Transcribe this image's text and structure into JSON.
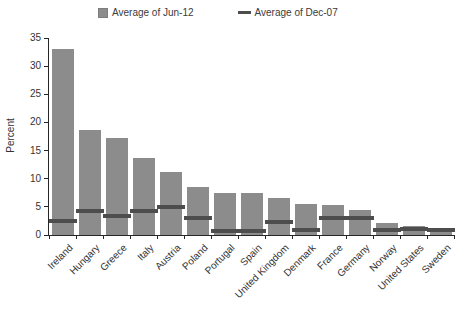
{
  "legend": {
    "items": [
      {
        "label": "Average of Jun-12",
        "marker": "square-icon",
        "color": "#8c8c8c"
      },
      {
        "label": "Average of Dec-07",
        "marker": "dash-icon",
        "color": "#4d4d4d"
      }
    ]
  },
  "chart_data": {
    "type": "bar",
    "title": "",
    "ylabel": "Percent",
    "xlabel": "",
    "ylim": [
      0,
      35
    ],
    "yticks": [
      0,
      5,
      10,
      15,
      20,
      25,
      30,
      35
    ],
    "grid": false,
    "legend_position": "top",
    "categories": [
      "Ireland",
      "Hungary",
      "Greece",
      "Italy",
      "Austria",
      "Poland",
      "Portugal",
      "Spain",
      "United Kingdom",
      "Denmark",
      "France",
      "Germany",
      "Norway",
      "United States",
      "Sweden"
    ],
    "series": [
      {
        "name": "Average of Jun-12",
        "style": "bar",
        "color": "#8c8c8c",
        "values": [
          33.0,
          18.6,
          17.3,
          13.7,
          11.2,
          8.6,
          7.5,
          7.4,
          6.5,
          5.5,
          5.3,
          4.4,
          2.1,
          1.6,
          1.3
        ]
      },
      {
        "name": "Average of Dec-07",
        "style": "dash",
        "color": "#4d4d4d",
        "values": [
          2.5,
          4.2,
          3.3,
          4.3,
          5.0,
          3.1,
          0.8,
          0.7,
          2.3,
          0.9,
          3.0,
          3.0,
          0.9,
          1.1,
          0.9
        ]
      }
    ]
  }
}
